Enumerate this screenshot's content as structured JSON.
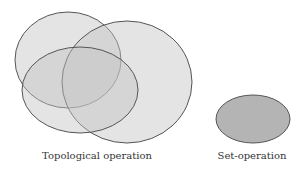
{
  "diagram": {
    "left_group": {
      "caption": "Topological operation",
      "ellipses": [
        {
          "name": "top-left",
          "cx": 68,
          "cy": 60,
          "rx": 53,
          "ry": 48
        },
        {
          "name": "right-large",
          "cx": 127,
          "cy": 82,
          "rx": 65,
          "ry": 61
        },
        {
          "name": "bottom-left",
          "cx": 80,
          "cy": 90,
          "rx": 58,
          "ry": 43
        }
      ]
    },
    "right_group": {
      "caption": "Set-operation",
      "ellipse": {
        "cx": 253,
        "cy": 119,
        "rx": 37,
        "ry": 24
      }
    },
    "colors": {
      "fill": "#c8c8c8",
      "stroke": "#555555",
      "set_fill": "#b4b4b4"
    }
  }
}
